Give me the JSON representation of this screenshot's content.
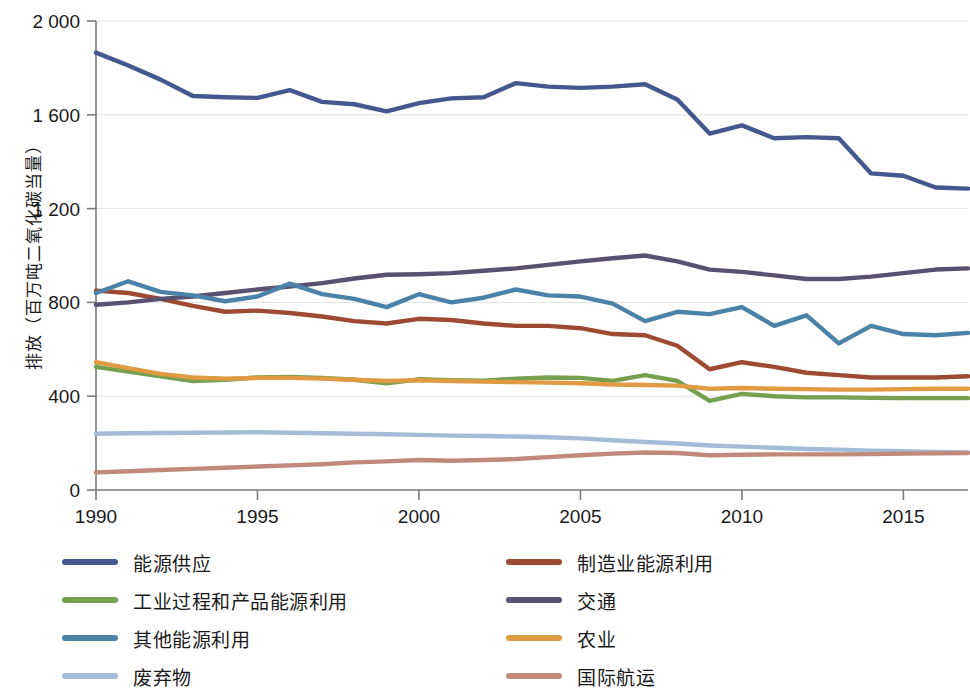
{
  "chart_data": {
    "type": "line",
    "title": "",
    "subtitle": "",
    "xlabel": "",
    "ylabel": "排放（百万吨二氧化碳当量）",
    "xlim": [
      1990,
      2017
    ],
    "ylim": [
      0,
      2000
    ],
    "grid": true,
    "legend_position": "bottom",
    "y_ticks": [
      0,
      400,
      800,
      1200,
      1600,
      2000
    ],
    "y_tick_labels": [
      "0",
      "400",
      "800",
      "1 200",
      "1 600",
      "2 000"
    ],
    "x_ticks": [
      1990,
      1995,
      2000,
      2005,
      2010,
      2015
    ],
    "x_tick_labels": [
      "1990",
      "1995",
      "2000",
      "2005",
      "2010",
      "2015"
    ],
    "x": [
      1990,
      1991,
      1992,
      1993,
      1994,
      1995,
      1996,
      1997,
      1998,
      1999,
      2000,
      2001,
      2002,
      2003,
      2004,
      2005,
      2006,
      2007,
      2008,
      2009,
      2010,
      2011,
      2012,
      2013,
      2014,
      2015,
      2016,
      2017
    ],
    "series": [
      {
        "name": "能源供应",
        "color": "#44588f",
        "values": [
          1865,
          1810,
          1750,
          1680,
          1675,
          1672,
          1705,
          1655,
          1645,
          1615,
          1650,
          1670,
          1675,
          1735,
          1720,
          1715,
          1720,
          1730,
          1665,
          1520,
          1555,
          1500,
          1505,
          1500,
          1350,
          1340,
          1290,
          1285
        ]
      },
      {
        "name": "制造业能源利用",
        "color": "#9c4a32",
        "values": [
          850,
          840,
          815,
          785,
          760,
          765,
          755,
          740,
          720,
          710,
          730,
          725,
          710,
          700,
          700,
          690,
          665,
          660,
          615,
          515,
          545,
          525,
          500,
          490,
          480,
          480,
          480,
          485
        ]
      },
      {
        "name": "工业过程和产品能源利用",
        "color": "#76a04f",
        "values": [
          525,
          505,
          485,
          465,
          470,
          480,
          482,
          478,
          470,
          455,
          472,
          468,
          466,
          475,
          480,
          478,
          465,
          490,
          465,
          380,
          410,
          400,
          395,
          395,
          393,
          392,
          392,
          392
        ]
      },
      {
        "name": "交通",
        "color": "#5a5070",
        "values": [
          790,
          800,
          815,
          825,
          840,
          855,
          868,
          882,
          902,
          918,
          920,
          925,
          935,
          945,
          960,
          975,
          988,
          1000,
          975,
          940,
          930,
          915,
          900,
          900,
          910,
          925,
          940,
          945
        ]
      },
      {
        "name": "其他能源利用",
        "color": "#4a82a8",
        "values": [
          840,
          890,
          845,
          830,
          805,
          825,
          880,
          835,
          815,
          780,
          835,
          800,
          820,
          855,
          830,
          825,
          795,
          720,
          760,
          750,
          780,
          700,
          745,
          625,
          700,
          665,
          660,
          670
        ]
      },
      {
        "name": "农业",
        "color": "#e09a42",
        "values": [
          545,
          520,
          495,
          480,
          475,
          478,
          478,
          475,
          470,
          465,
          468,
          465,
          462,
          460,
          458,
          455,
          450,
          448,
          445,
          432,
          435,
          432,
          430,
          428,
          428,
          430,
          432,
          432
        ]
      },
      {
        "name": "废弃物",
        "color": "#a5bcd9",
        "values": [
          240,
          242,
          243,
          244,
          245,
          246,
          244,
          242,
          240,
          238,
          235,
          232,
          230,
          228,
          225,
          220,
          212,
          205,
          198,
          190,
          185,
          180,
          175,
          172,
          168,
          165,
          162,
          160
        ]
      },
      {
        "name": "国际航运",
        "color": "#c1897a",
        "values": [
          75,
          80,
          85,
          90,
          95,
          100,
          105,
          110,
          118,
          122,
          128,
          125,
          128,
          132,
          140,
          148,
          155,
          160,
          158,
          148,
          150,
          152,
          152,
          152,
          153,
          155,
          156,
          158
        ]
      }
    ]
  },
  "legend": {
    "items": [
      {
        "label": "能源供应",
        "color": "#44588f"
      },
      {
        "label": "制造业能源利用",
        "color": "#9c4a32"
      },
      {
        "label": "工业过程和产品能源利用",
        "color": "#76a04f"
      },
      {
        "label": "交通",
        "color": "#5a5070"
      },
      {
        "label": "其他能源利用",
        "color": "#4a82a8"
      },
      {
        "label": "农业",
        "color": "#e09a42"
      },
      {
        "label": "废弃物",
        "color": "#a5bcd9"
      },
      {
        "label": "国际航运",
        "color": "#c1897a"
      }
    ]
  },
  "axes": {
    "y_title": "排放（百万吨二氧化碳当量）"
  }
}
